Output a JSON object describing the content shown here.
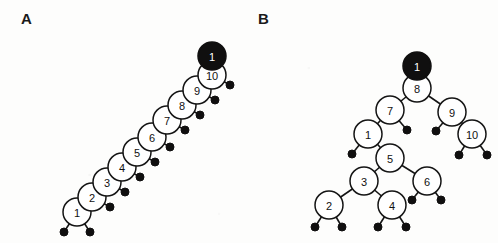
{
  "figure": {
    "width": 498,
    "height": 243,
    "background_color": "#fdfdfc",
    "node_fill_color": "#ffffff",
    "node_stroke_color": "#141414",
    "highlight_color": "#100f0f",
    "leaf_color": "#100f0f"
  },
  "panels": [
    {
      "id": "A",
      "label": "A",
      "label_x": 21,
      "label_y": 11,
      "description": "degenerate right-leaning chain of ten internal nodes",
      "node_radius": 14,
      "leaf_radius": 4,
      "nodes": [
        {
          "name": "node-1",
          "label": "1",
          "x": 77,
          "y": 212,
          "filled": false
        },
        {
          "name": "node-2",
          "label": "2",
          "x": 92,
          "y": 197,
          "filled": false
        },
        {
          "name": "node-3",
          "label": "3",
          "x": 107,
          "y": 182,
          "filled": false
        },
        {
          "name": "node-4",
          "label": "4",
          "x": 122,
          "y": 167,
          "filled": false
        },
        {
          "name": "node-5",
          "label": "5",
          "x": 137,
          "y": 152,
          "filled": false
        },
        {
          "name": "node-6",
          "label": "6",
          "x": 152,
          "y": 137,
          "filled": false
        },
        {
          "name": "node-7",
          "label": "7",
          "x": 167,
          "y": 120,
          "filled": false
        },
        {
          "name": "node-8",
          "label": "8",
          "x": 182,
          "y": 105,
          "filled": false
        },
        {
          "name": "node-9",
          "label": "9",
          "x": 197,
          "y": 90,
          "filled": false
        },
        {
          "name": "node-10",
          "label": "10",
          "x": 212,
          "y": 75,
          "filled": false
        },
        {
          "name": "node-highlight",
          "label": "1",
          "x": 212,
          "y": 56,
          "filled": true
        }
      ],
      "leaves": [
        {
          "name": "leaf-1-left",
          "x": 64,
          "y": 232
        },
        {
          "name": "leaf-1-right",
          "x": 90,
          "y": 232
        },
        {
          "name": "leaf-2",
          "x": 110,
          "y": 207
        },
        {
          "name": "leaf-3",
          "x": 125,
          "y": 192
        },
        {
          "name": "leaf-4",
          "x": 140,
          "y": 177
        },
        {
          "name": "leaf-5",
          "x": 155,
          "y": 162
        },
        {
          "name": "leaf-6",
          "x": 170,
          "y": 147
        },
        {
          "name": "leaf-7",
          "x": 185,
          "y": 130
        },
        {
          "name": "leaf-8",
          "x": 200,
          "y": 115
        },
        {
          "name": "leaf-9",
          "x": 215,
          "y": 100
        },
        {
          "name": "leaf-10",
          "x": 230,
          "y": 85
        }
      ],
      "edges": [
        {
          "name": "edge-1-2",
          "from": "node-1",
          "to": "node-2"
        },
        {
          "name": "edge-2-3",
          "from": "node-2",
          "to": "node-3"
        },
        {
          "name": "edge-3-4",
          "from": "node-3",
          "to": "node-4"
        },
        {
          "name": "edge-4-5",
          "from": "node-4",
          "to": "node-5"
        },
        {
          "name": "edge-5-6",
          "from": "node-5",
          "to": "node-6"
        },
        {
          "name": "edge-6-7",
          "from": "node-6",
          "to": "node-7"
        },
        {
          "name": "edge-7-8",
          "from": "node-7",
          "to": "node-8"
        },
        {
          "name": "edge-8-9",
          "from": "node-8",
          "to": "node-9"
        },
        {
          "name": "edge-9-10",
          "from": "node-9",
          "to": "node-10"
        },
        {
          "name": "edge-1-leafL",
          "from": "node-1",
          "to": "leaf-1-left"
        },
        {
          "name": "edge-1-leafR",
          "from": "node-1",
          "to": "leaf-1-right"
        },
        {
          "name": "edge-2-leaf",
          "from": "node-2",
          "to": "leaf-2"
        },
        {
          "name": "edge-3-leaf",
          "from": "node-3",
          "to": "leaf-3"
        },
        {
          "name": "edge-4-leaf",
          "from": "node-4",
          "to": "leaf-4"
        },
        {
          "name": "edge-5-leaf",
          "from": "node-5",
          "to": "leaf-5"
        },
        {
          "name": "edge-6-leaf",
          "from": "node-6",
          "to": "leaf-6"
        },
        {
          "name": "edge-7-leaf",
          "from": "node-7",
          "to": "leaf-7"
        },
        {
          "name": "edge-8-leaf",
          "from": "node-8",
          "to": "leaf-8"
        },
        {
          "name": "edge-9-leaf",
          "from": "node-9",
          "to": "leaf-9"
        },
        {
          "name": "edge-10-leaf",
          "from": "node-10",
          "to": "leaf-10"
        }
      ]
    },
    {
      "id": "B",
      "label": "B",
      "label_x": 258,
      "label_y": 11,
      "description": "balanced binary search tree rooted at 8",
      "node_radius": 14,
      "leaf_radius": 4,
      "nodes": [
        {
          "name": "node-8",
          "label": "8",
          "x": 417,
          "y": 88,
          "filled": false
        },
        {
          "name": "node-7",
          "label": "7",
          "x": 390,
          "y": 110,
          "filled": false
        },
        {
          "name": "node-9",
          "label": "9",
          "x": 452,
          "y": 112,
          "filled": false
        },
        {
          "name": "node-1",
          "label": "1",
          "x": 368,
          "y": 134,
          "filled": false
        },
        {
          "name": "node-10",
          "label": "10",
          "x": 472,
          "y": 134,
          "filled": false
        },
        {
          "name": "node-5",
          "label": "5",
          "x": 390,
          "y": 158,
          "filled": false
        },
        {
          "name": "node-3",
          "label": "3",
          "x": 364,
          "y": 181,
          "filled": false
        },
        {
          "name": "node-6",
          "label": "6",
          "x": 427,
          "y": 181,
          "filled": false
        },
        {
          "name": "node-2",
          "label": "2",
          "x": 329,
          "y": 205,
          "filled": false
        },
        {
          "name": "node-4",
          "label": "4",
          "x": 392,
          "y": 205,
          "filled": false
        },
        {
          "name": "node-highlight",
          "label": "1",
          "x": 417,
          "y": 66,
          "filled": true
        }
      ],
      "leaves": [
        {
          "name": "leaf-7-right",
          "x": 407,
          "y": 130
        },
        {
          "name": "leaf-9-left",
          "x": 436,
          "y": 131
        },
        {
          "name": "leaf-1-left",
          "x": 352,
          "y": 154
        },
        {
          "name": "leaf-10-left",
          "x": 459,
          "y": 155
        },
        {
          "name": "leaf-10-right",
          "x": 487,
          "y": 155
        },
        {
          "name": "leaf-6-left",
          "x": 412,
          "y": 200
        },
        {
          "name": "leaf-6-right",
          "x": 441,
          "y": 200
        },
        {
          "name": "leaf-2-left",
          "x": 315,
          "y": 227
        },
        {
          "name": "leaf-2-right",
          "x": 342,
          "y": 227
        },
        {
          "name": "leaf-4-left",
          "x": 378,
          "y": 227
        },
        {
          "name": "leaf-4-right",
          "x": 406,
          "y": 227
        }
      ],
      "edges": [
        {
          "name": "edge-8-7",
          "from": "node-8",
          "to": "node-7"
        },
        {
          "name": "edge-8-9",
          "from": "node-8",
          "to": "node-9"
        },
        {
          "name": "edge-7-1",
          "from": "node-7",
          "to": "node-1"
        },
        {
          "name": "edge-7-leafR",
          "from": "node-7",
          "to": "leaf-7-right"
        },
        {
          "name": "edge-9-leafL",
          "from": "node-9",
          "to": "leaf-9-left"
        },
        {
          "name": "edge-9-10",
          "from": "node-9",
          "to": "node-10"
        },
        {
          "name": "edge-1-leafL",
          "from": "node-1",
          "to": "leaf-1-left"
        },
        {
          "name": "edge-1-5",
          "from": "node-1",
          "to": "node-5"
        },
        {
          "name": "edge-10-leafL",
          "from": "node-10",
          "to": "leaf-10-left"
        },
        {
          "name": "edge-10-leafR",
          "from": "node-10",
          "to": "leaf-10-right"
        },
        {
          "name": "edge-5-3",
          "from": "node-5",
          "to": "node-3"
        },
        {
          "name": "edge-5-6",
          "from": "node-5",
          "to": "node-6"
        },
        {
          "name": "edge-3-2",
          "from": "node-3",
          "to": "node-2"
        },
        {
          "name": "edge-3-4",
          "from": "node-3",
          "to": "node-4"
        },
        {
          "name": "edge-6-leafL",
          "from": "node-6",
          "to": "leaf-6-left"
        },
        {
          "name": "edge-6-leafR",
          "from": "node-6",
          "to": "leaf-6-right"
        },
        {
          "name": "edge-2-leafL",
          "from": "node-2",
          "to": "leaf-2-left"
        },
        {
          "name": "edge-2-leafR",
          "from": "node-2",
          "to": "leaf-2-right"
        },
        {
          "name": "edge-4-leafL",
          "from": "node-4",
          "to": "leaf-4-left"
        },
        {
          "name": "edge-4-leafR",
          "from": "node-4",
          "to": "leaf-4-right"
        }
      ]
    }
  ]
}
